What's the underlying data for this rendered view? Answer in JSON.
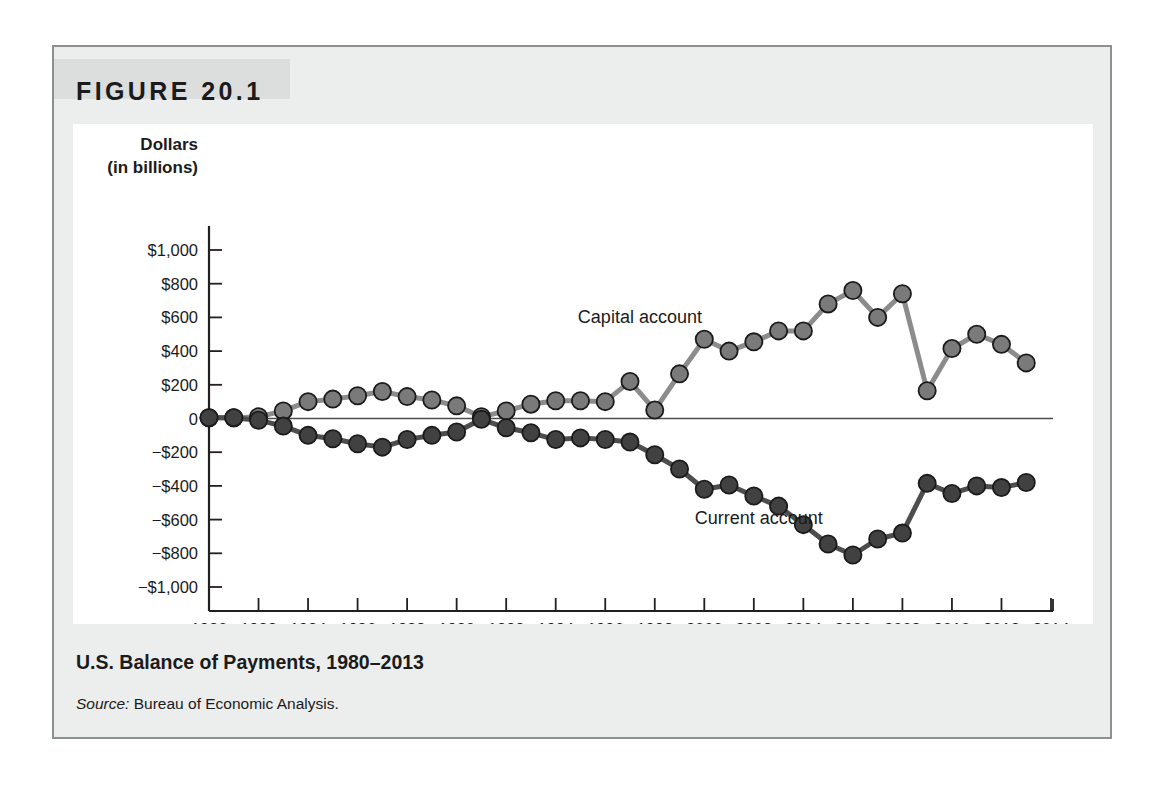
{
  "figure": {
    "number_label": "FIGURE 20.1",
    "caption_title": "U.S. Balance of Payments, 1980–2013",
    "source_prefix": "Source:",
    "source_text": " Bureau of Economic Analysis."
  },
  "colors": {
    "card_background": "#eceded",
    "card_border": "#8d9093",
    "banner_background": "#dcdddd",
    "plot_background": "#ffffff",
    "axis": "#231f20",
    "zero_line": "#4d4d4d",
    "capital_account": "#8c8c8c",
    "capital_account_marker": "#7a7a7a",
    "current_account": "#4d4d4d",
    "current_account_marker": "#414141",
    "marker_outline": "#1b1b1b",
    "text": "#1b1b1b"
  },
  "chart_data": {
    "type": "line",
    "title": "U.S. Balance of Payments, 1980–2013",
    "xlabel": "Year",
    "ylabel": "Dollars (in billions)",
    "ylabel_line1": "Dollars",
    "ylabel_line2": "(in billions)",
    "xlim": [
      1980,
      2014
    ],
    "ylim": [
      -1000,
      1000
    ],
    "grid": false,
    "zero_line": true,
    "legend_position": "inline-annotation",
    "y_ticks": [
      1000,
      800,
      600,
      400,
      200,
      0,
      -200,
      -400,
      -600,
      -800,
      -1000
    ],
    "y_tick_labels": [
      "$1,000",
      "$800",
      "$600",
      "$400",
      "$200",
      "0",
      "−$200",
      "−$400",
      "−$600",
      "−$800",
      "−$1,000"
    ],
    "x_ticks": [
      1980,
      1982,
      1984,
      1986,
      1988,
      1990,
      1992,
      1994,
      1996,
      1998,
      2000,
      2002,
      2004,
      2006,
      2008,
      2010,
      2012,
      2014
    ],
    "x_tick_labels": [
      "1980",
      "1982",
      "1984",
      "1986",
      "1988",
      "1990",
      "1992",
      "1994",
      "1996",
      "1998",
      "2000",
      "2002",
      "2004",
      "2006",
      "2008",
      "2010",
      "2012",
      "2014"
    ],
    "x": [
      1980,
      1981,
      1982,
      1983,
      1984,
      1985,
      1986,
      1987,
      1988,
      1989,
      1990,
      1991,
      1992,
      1993,
      1994,
      1995,
      1996,
      1997,
      1998,
      1999,
      2000,
      2001,
      2002,
      2003,
      2004,
      2005,
      2006,
      2007,
      2008,
      2009,
      2010,
      2011,
      2012,
      2013
    ],
    "series": [
      {
        "name": "Capital account",
        "label": "Capital account",
        "color": "#8c8c8c",
        "label_x": 1997.4,
        "label_y": 600,
        "values": [
          5,
          5,
          10,
          45,
          100,
          115,
          135,
          160,
          130,
          110,
          75,
          10,
          45,
          85,
          105,
          105,
          100,
          220,
          50,
          265,
          470,
          400,
          455,
          520,
          520,
          680,
          760,
          600,
          740,
          165,
          415,
          500,
          440,
          330
        ]
      },
      {
        "name": "Current account",
        "label": "Current account",
        "color": "#4d4d4d",
        "label_x": 2002.2,
        "label_y": -590,
        "values": [
          5,
          5,
          -10,
          -45,
          -100,
          -120,
          -150,
          -170,
          -125,
          -100,
          -80,
          -5,
          -55,
          -85,
          -125,
          -115,
          -125,
          -140,
          -215,
          -300,
          -420,
          -395,
          -460,
          -520,
          -630,
          -745,
          -810,
          -715,
          -680,
          -385,
          -445,
          -400,
          -410,
          -380
        ]
      }
    ],
    "annotations": [
      {
        "text": "Capital account",
        "x": 1997.4,
        "y": 600
      },
      {
        "text": "Current account",
        "x": 2002.2,
        "y": -590
      }
    ]
  }
}
